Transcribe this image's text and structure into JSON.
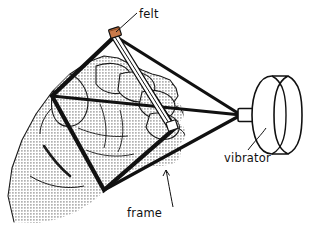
{
  "figure": {
    "background_color": "#ffffff",
    "ink_color": "#111111",
    "skin_shading_color": "#d9d9d9",
    "felt_accent_color": "#b5663a",
    "width": 321,
    "height": 230
  },
  "labels": {
    "felt": "felt",
    "vibrator": "vibrator",
    "frame": "frame"
  },
  "parts": [
    {
      "name": "felt",
      "label": "felt",
      "description": "narrow felt strip clamped between the top vertex and the lower-right vertex of the frame",
      "label_x": 140,
      "label_y": 16
    },
    {
      "name": "frame",
      "label": "frame",
      "description": "quadrilateral wire frame held in the hand",
      "label_x": 128,
      "label_y": 214
    },
    {
      "name": "vibrator",
      "label": "vibrator",
      "description": "cylindrical vibrator unit connected by three tensioned cords to the frame",
      "label_x": 225,
      "label_y": 158
    },
    {
      "name": "hand",
      "label": "",
      "description": "halftone-shaded hand gripping the frame",
      "label_x": 0,
      "label_y": 0
    }
  ],
  "geometry": {
    "frame_vertices": [
      {
        "id": "top",
        "x": 115,
        "y": 36
      },
      {
        "id": "left",
        "x": 52,
        "y": 96
      },
      {
        "id": "bottom",
        "x": 104,
        "y": 190
      },
      {
        "id": "right",
        "x": 175,
        "y": 128
      }
    ],
    "cord_convergence_point": {
      "x": 241,
      "y": 115
    },
    "vibrator_shaft": {
      "x": 241,
      "y": 109,
      "width": 14,
      "height": 13
    },
    "vibrator_body": {
      "cx": 272,
      "cy": 115,
      "rx": 18,
      "ry": 40
    }
  }
}
